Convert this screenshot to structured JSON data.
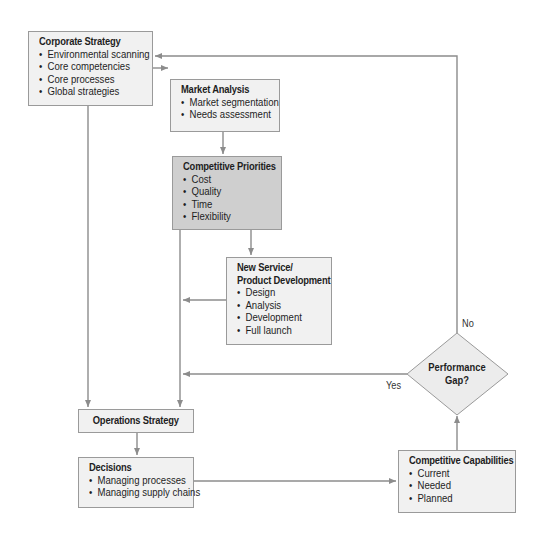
{
  "diagram": {
    "colors": {
      "box_fill": "#f1f1f1",
      "highlight_fill": "#cfcfcf",
      "border": "#9a9a9a",
      "connector": "#8c8c8c",
      "text": "#1e1e1e"
    },
    "nodes": {
      "corporate_strategy": {
        "title": "Corporate Strategy",
        "items": [
          "Environmental scanning",
          "Core competencies",
          "Core processes",
          "Global strategies"
        ]
      },
      "market_analysis": {
        "title": "Market Analysis",
        "items": [
          "Market segmentation",
          "Needs assessment"
        ]
      },
      "competitive_priorities": {
        "title": "Competitive Priorities",
        "items": [
          "Cost",
          "Quality",
          "Time",
          "Flexibility"
        ]
      },
      "new_service": {
        "title_line1": "New Service/",
        "title_line2": "Product Development",
        "items": [
          "Design",
          "Analysis",
          "Development",
          "Full launch"
        ]
      },
      "operations_strategy": {
        "title": "Operations Strategy"
      },
      "decisions": {
        "title": "Decisions",
        "items": [
          "Managing processes",
          "Managing supply chains"
        ]
      },
      "competitive_capabilities": {
        "title": "Competitive Capabilities",
        "items": [
          "Current",
          "Needed",
          "Planned"
        ]
      },
      "performance_gap": {
        "line1": "Performance",
        "line2": "Gap?"
      }
    },
    "edge_labels": {
      "no": "No",
      "yes": "Yes"
    },
    "edges": [
      {
        "from": "corporate_strategy",
        "to": "market_analysis"
      },
      {
        "from": "corporate_strategy",
        "to": "operations_strategy"
      },
      {
        "from": "market_analysis",
        "to": "competitive_priorities"
      },
      {
        "from": "competitive_priorities",
        "to": "new_service"
      },
      {
        "from": "competitive_priorities",
        "to": "operations_strategy"
      },
      {
        "from": "new_service",
        "to": "operations_strategy"
      },
      {
        "from": "operations_strategy",
        "to": "decisions"
      },
      {
        "from": "decisions",
        "to": "competitive_capabilities"
      },
      {
        "from": "competitive_capabilities",
        "to": "performance_gap"
      },
      {
        "from": "performance_gap",
        "to": "operations_strategy",
        "label": "Yes"
      },
      {
        "from": "performance_gap",
        "to": "corporate_strategy",
        "label": "No"
      }
    ]
  }
}
